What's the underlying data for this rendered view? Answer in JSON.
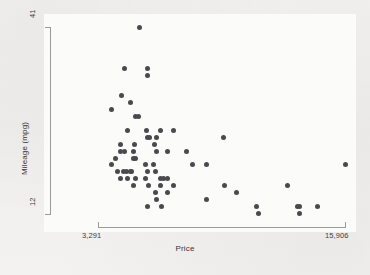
{
  "figure": {
    "background_color": "#f2f1ef",
    "plot_background_color": "#fbfbfa",
    "marker_color": "#4a4a4e",
    "axis_color": "#9a9a9c"
  },
  "axes": {
    "x_title": "Price",
    "y_title": "Mileage (mpg)",
    "x_tick_min_label": "3,291",
    "x_tick_max_label": "15,906",
    "y_tick_min_label": "12",
    "y_tick_max_label": "41"
  },
  "chart_data": {
    "type": "scatter",
    "title": "",
    "xlabel": "Price",
    "ylabel": "Mileage (mpg)",
    "xlim": [
      3291,
      15906
    ],
    "ylim": [
      12,
      41
    ],
    "xticks": [
      3291,
      15906
    ],
    "xticklabels": [
      "3,291",
      "15,906"
    ],
    "yticks": [
      12,
      41
    ],
    "yticklabels": [
      "12",
      "41"
    ],
    "grid": false,
    "legend": false,
    "marker": "filled-circle",
    "marker_color": "#4a4a4e",
    "points": [
      {
        "x": 5397,
        "y": 41
      },
      {
        "x": 4647,
        "y": 35
      },
      {
        "x": 5799,
        "y": 35
      },
      {
        "x": 5799,
        "y": 34
      },
      {
        "x": 4499,
        "y": 31
      },
      {
        "x": 4934,
        "y": 30
      },
      {
        "x": 3984,
        "y": 29
      },
      {
        "x": 5189,
        "y": 28
      },
      {
        "x": 5379,
        "y": 28
      },
      {
        "x": 4816,
        "y": 26
      },
      {
        "x": 5788,
        "y": 26
      },
      {
        "x": 6486,
        "y": 26
      },
      {
        "x": 7140,
        "y": 26
      },
      {
        "x": 5799,
        "y": 25
      },
      {
        "x": 5899,
        "y": 25
      },
      {
        "x": 6295,
        "y": 25
      },
      {
        "x": 9690,
        "y": 25
      },
      {
        "x": 4453,
        "y": 24
      },
      {
        "x": 5172,
        "y": 24
      },
      {
        "x": 6165,
        "y": 24
      },
      {
        "x": 4424,
        "y": 23
      },
      {
        "x": 4668,
        "y": 23
      },
      {
        "x": 5104,
        "y": 23
      },
      {
        "x": 6303,
        "y": 23
      },
      {
        "x": 6851,
        "y": 23
      },
      {
        "x": 7827,
        "y": 23
      },
      {
        "x": 4195,
        "y": 22
      },
      {
        "x": 5079,
        "y": 22
      },
      {
        "x": 5222,
        "y": 22
      },
      {
        "x": 3984,
        "y": 21
      },
      {
        "x": 5705,
        "y": 21
      },
      {
        "x": 6142,
        "y": 21
      },
      {
        "x": 8129,
        "y": 21
      },
      {
        "x": 8814,
        "y": 21
      },
      {
        "x": 15906,
        "y": 21
      },
      {
        "x": 4296,
        "y": 20
      },
      {
        "x": 4589,
        "y": 20
      },
      {
        "x": 4741,
        "y": 20
      },
      {
        "x": 4934,
        "y": 20
      },
      {
        "x": 5006,
        "y": 20
      },
      {
        "x": 5798,
        "y": 20
      },
      {
        "x": 6229,
        "y": 20
      },
      {
        "x": 4452,
        "y": 19
      },
      {
        "x": 4816,
        "y": 19
      },
      {
        "x": 5222,
        "y": 19
      },
      {
        "x": 5705,
        "y": 19
      },
      {
        "x": 6486,
        "y": 19
      },
      {
        "x": 6639,
        "y": 19
      },
      {
        "x": 6850,
        "y": 19
      },
      {
        "x": 5104,
        "y": 18
      },
      {
        "x": 5886,
        "y": 18
      },
      {
        "x": 6486,
        "y": 18
      },
      {
        "x": 7140,
        "y": 18
      },
      {
        "x": 9735,
        "y": 18
      },
      {
        "x": 12990,
        "y": 18
      },
      {
        "x": 6229,
        "y": 17
      },
      {
        "x": 6850,
        "y": 17
      },
      {
        "x": 10371,
        "y": 17
      },
      {
        "x": 6303,
        "y": 16
      },
      {
        "x": 8814,
        "y": 16
      },
      {
        "x": 5798,
        "y": 15
      },
      {
        "x": 6551,
        "y": 15
      },
      {
        "x": 11385,
        "y": 15
      },
      {
        "x": 13466,
        "y": 15
      },
      {
        "x": 13594,
        "y": 15
      },
      {
        "x": 14500,
        "y": 15
      },
      {
        "x": 11497,
        "y": 14
      },
      {
        "x": 13594,
        "y": 14
      }
    ]
  }
}
